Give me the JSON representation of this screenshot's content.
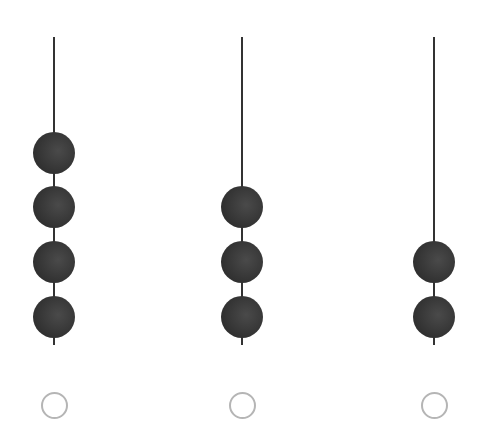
{
  "options": [
    {
      "id": "option-1",
      "bead_count": 4,
      "rod_x": 54,
      "bead_centers_y": [
        153,
        207,
        262,
        317
      ],
      "selected": false
    },
    {
      "id": "option-2",
      "bead_count": 3,
      "rod_x": 242,
      "bead_centers_y": [
        207,
        262,
        317
      ],
      "selected": false
    },
    {
      "id": "option-3",
      "bead_count": 2,
      "rod_x": 434,
      "bead_centers_y": [
        262,
        317
      ],
      "selected": false
    }
  ],
  "colors": {
    "bead": "#363636",
    "rod": "#333333",
    "radio_border": "#b5b5b5",
    "background": "#ffffff"
  }
}
